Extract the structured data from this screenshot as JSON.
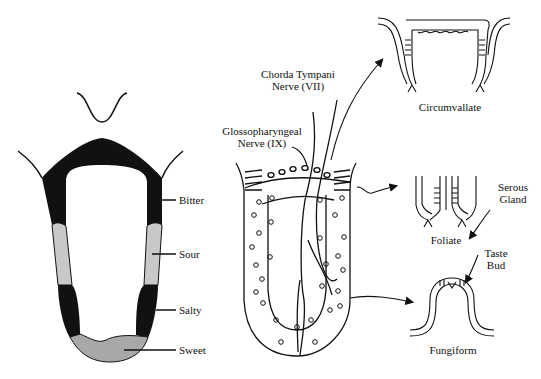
{
  "tongue_map": {
    "zones": [
      {
        "label": "Bitter",
        "color": "#111111"
      },
      {
        "label": "Sour",
        "color": "#c8c8c8"
      },
      {
        "label": "Salty",
        "color": "#111111"
      },
      {
        "label": "Sweet",
        "color": "#a8a8a8"
      }
    ]
  },
  "nerves": {
    "chorda_tympani": {
      "line1": "Chorda Tympani",
      "line2": "Nerve (VII)"
    },
    "glossopharyngeal": {
      "line1": "Glossopharyngeal",
      "line2": "Nerve (IX)"
    }
  },
  "papillae": {
    "circumvallate": {
      "label": "Circumvallate"
    },
    "foliate": {
      "label": "Foliate"
    },
    "fungiform": {
      "label": "Fungiform"
    }
  },
  "annotations": {
    "serous_gland": {
      "line1": "Serous",
      "line2": "Gland"
    },
    "taste_bud": {
      "line1": "Taste",
      "line2": "Bud"
    }
  }
}
